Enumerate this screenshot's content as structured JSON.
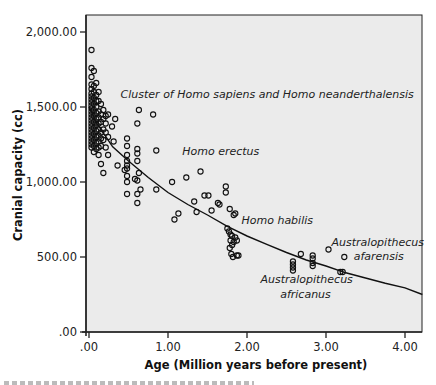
{
  "chart_data": {
    "type": "scatter",
    "title": "",
    "xlabel": "Age (Million years before present)",
    "ylabel": "Cranial capacity (cc)",
    "xlim": [
      0,
      4.22
    ],
    "ylim": [
      0,
      2000
    ],
    "grid": false,
    "legend": null,
    "x_ticks": [
      0,
      1,
      2,
      3,
      4
    ],
    "x_tick_labels": [
      ".00",
      "1.00",
      "2.00",
      "3.00",
      "4.00"
    ],
    "y_ticks": [
      0,
      500,
      1000,
      1500,
      2000
    ],
    "y_tick_labels": [
      ".00",
      "500.00",
      "1,000.00",
      "1,500.00",
      "2,000.00"
    ],
    "plot_background": "#ebebeb",
    "marker": "open-circle",
    "annotations": [
      {
        "text": "Cluster of Homo sapiens and Homo neanderthalensis",
        "x": 0.4,
        "y": 1560
      },
      {
        "text": "Homo erectus",
        "x": 1.18,
        "y": 1180
      },
      {
        "text": "Homo habilis",
        "x": 1.93,
        "y": 720
      },
      {
        "text": "Australopithecus",
        "x": 3.07,
        "y": 575
      },
      {
        "text": "afarensis",
        "x": 3.35,
        "y": 480
      },
      {
        "text": "Australopithecus",
        "x": 2.17,
        "y": 325
      },
      {
        "text": "africanus",
        "x": 2.42,
        "y": 230
      }
    ],
    "series": [
      {
        "name": "fossil specimens",
        "type": "scatter",
        "points": [
          [
            0.0,
            1880
          ],
          [
            0.0,
            1760
          ],
          [
            0.0,
            1700
          ],
          [
            0.0,
            1650
          ],
          [
            0.0,
            1620
          ],
          [
            0.0,
            1590
          ],
          [
            0.0,
            1570
          ],
          [
            0.0,
            1550
          ],
          [
            0.0,
            1530
          ],
          [
            0.0,
            1510
          ],
          [
            0.0,
            1490
          ],
          [
            0.0,
            1470
          ],
          [
            0.0,
            1450
          ],
          [
            0.0,
            1430
          ],
          [
            0.0,
            1410
          ],
          [
            0.0,
            1390
          ],
          [
            0.0,
            1370
          ],
          [
            0.0,
            1350
          ],
          [
            0.0,
            1330
          ],
          [
            0.0,
            1310
          ],
          [
            0.0,
            1290
          ],
          [
            0.0,
            1270
          ],
          [
            0.0,
            1250
          ],
          [
            0.0,
            1230
          ],
          [
            0.03,
            1740
          ],
          [
            0.03,
            1640
          ],
          [
            0.03,
            1600
          ],
          [
            0.03,
            1560
          ],
          [
            0.03,
            1520
          ],
          [
            0.03,
            1480
          ],
          [
            0.03,
            1440
          ],
          [
            0.03,
            1400
          ],
          [
            0.03,
            1360
          ],
          [
            0.03,
            1320
          ],
          [
            0.03,
            1280
          ],
          [
            0.03,
            1240
          ],
          [
            0.03,
            1200
          ],
          [
            0.06,
            1660
          ],
          [
            0.06,
            1580
          ],
          [
            0.06,
            1540
          ],
          [
            0.06,
            1500
          ],
          [
            0.06,
            1460
          ],
          [
            0.06,
            1420
          ],
          [
            0.06,
            1380
          ],
          [
            0.06,
            1340
          ],
          [
            0.06,
            1300
          ],
          [
            0.06,
            1260
          ],
          [
            0.06,
            1220
          ],
          [
            0.09,
            1600
          ],
          [
            0.09,
            1540
          ],
          [
            0.09,
            1470
          ],
          [
            0.09,
            1430
          ],
          [
            0.09,
            1390
          ],
          [
            0.09,
            1350
          ],
          [
            0.09,
            1310
          ],
          [
            0.09,
            1270
          ],
          [
            0.09,
            1230
          ],
          [
            0.09,
            1180
          ],
          [
            0.12,
            1520
          ],
          [
            0.12,
            1450
          ],
          [
            0.12,
            1400
          ],
          [
            0.12,
            1330
          ],
          [
            0.12,
            1290
          ],
          [
            0.12,
            1240
          ],
          [
            0.12,
            1120
          ],
          [
            0.15,
            1480
          ],
          [
            0.15,
            1420
          ],
          [
            0.15,
            1350
          ],
          [
            0.15,
            1280
          ],
          [
            0.15,
            1060
          ],
          [
            0.18,
            1440
          ],
          [
            0.18,
            1390
          ],
          [
            0.18,
            1330
          ],
          [
            0.18,
            1230
          ],
          [
            0.21,
            1450
          ],
          [
            0.21,
            1300
          ],
          [
            0.21,
            1180
          ],
          [
            0.26,
            1370
          ],
          [
            0.28,
            1270
          ],
          [
            0.33,
            1110
          ],
          [
            0.3,
            1420
          ],
          [
            0.45,
            1290
          ],
          [
            0.45,
            1240
          ],
          [
            0.45,
            1180
          ],
          [
            0.45,
            1140
          ],
          [
            0.45,
            1110
          ],
          [
            0.45,
            1090
          ],
          [
            0.45,
            1040
          ],
          [
            0.45,
            1000
          ],
          [
            0.45,
            920
          ],
          [
            0.42,
            1080
          ],
          [
            0.58,
            1390
          ],
          [
            0.58,
            1220
          ],
          [
            0.58,
            1190
          ],
          [
            0.58,
            1140
          ],
          [
            0.58,
            1010
          ],
          [
            0.58,
            920
          ],
          [
            0.58,
            860
          ],
          [
            0.55,
            1020
          ],
          [
            0.62,
            950
          ],
          [
            0.6,
            1060
          ],
          [
            0.82,
            1210
          ],
          [
            0.82,
            950
          ],
          [
            0.6,
            1480
          ],
          [
            0.78,
            1450
          ],
          [
            1.02,
            1000
          ],
          [
            1.05,
            750
          ],
          [
            1.1,
            790
          ],
          [
            1.2,
            1030
          ],
          [
            1.3,
            870
          ],
          [
            1.33,
            800
          ],
          [
            1.38,
            1070
          ],
          [
            1.43,
            910
          ],
          [
            1.48,
            910
          ],
          [
            1.52,
            810
          ],
          [
            1.6,
            860
          ],
          [
            1.62,
            850
          ],
          [
            1.7,
            970
          ],
          [
            1.7,
            930
          ],
          [
            1.75,
            820
          ],
          [
            1.8,
            780
          ],
          [
            1.82,
            790
          ],
          [
            1.72,
            690
          ],
          [
            1.74,
            670
          ],
          [
            1.76,
            650
          ],
          [
            1.78,
            640
          ],
          [
            1.76,
            610
          ],
          [
            1.78,
            580
          ],
          [
            1.8,
            600
          ],
          [
            1.84,
            610
          ],
          [
            1.82,
            630
          ],
          [
            1.75,
            560
          ],
          [
            1.77,
            520
          ],
          [
            1.79,
            500
          ],
          [
            1.84,
            510
          ],
          [
            1.86,
            510
          ],
          [
            2.55,
            470
          ],
          [
            2.55,
            450
          ],
          [
            2.55,
            430
          ],
          [
            2.55,
            410
          ],
          [
            2.65,
            520
          ],
          [
            2.8,
            510
          ],
          [
            2.8,
            490
          ],
          [
            2.8,
            460
          ],
          [
            2.8,
            440
          ],
          [
            3.0,
            550
          ],
          [
            3.15,
            400
          ],
          [
            3.18,
            400
          ],
          [
            3.2,
            500
          ]
        ]
      },
      {
        "name": "fitted curve",
        "type": "line",
        "points": [
          [
            0.0,
            1500
          ],
          [
            0.1,
            1390
          ],
          [
            0.3,
            1235
          ],
          [
            0.5,
            1140
          ],
          [
            0.75,
            1030
          ],
          [
            1.0,
            930
          ],
          [
            1.25,
            850
          ],
          [
            1.5,
            780
          ],
          [
            1.75,
            705
          ],
          [
            2.0,
            640
          ],
          [
            2.25,
            585
          ],
          [
            2.5,
            530
          ],
          [
            2.75,
            480
          ],
          [
            3.0,
            440
          ],
          [
            3.25,
            395
          ],
          [
            3.5,
            360
          ],
          [
            3.75,
            325
          ],
          [
            4.0,
            295
          ],
          [
            4.22,
            250
          ]
        ]
      }
    ]
  },
  "layout_px": {
    "origin_x": 89,
    "origin_y": 332,
    "px_per_x": 79,
    "px_per_y": 0.15,
    "frame": {
      "left": 86,
      "top": 15,
      "right": 422,
      "bottom": 332
    }
  },
  "caption_fragment": "Figure caption (cut off at bottom edge)"
}
